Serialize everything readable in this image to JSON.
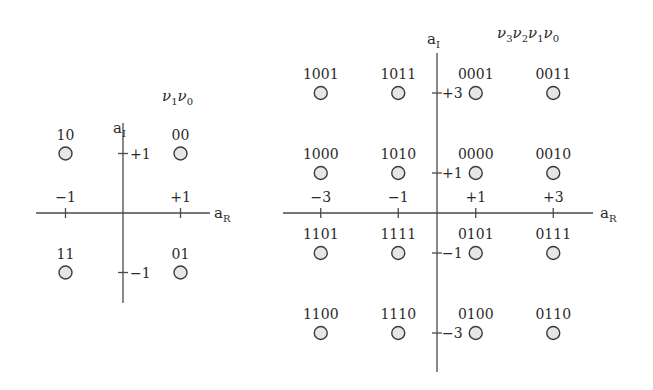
{
  "chart_data": [
    {
      "type": "scatter",
      "title": "QPSK constellation",
      "bit_label": {
        "symbol": "ν",
        "subscripts": [
          "1",
          "0"
        ]
      },
      "xlabel": {
        "base": "a",
        "sub": "R"
      },
      "ylabel": {
        "base": "a",
        "sub": "I"
      },
      "xlim": [
        -1.5,
        1.5
      ],
      "ylim": [
        -1.5,
        1.5
      ],
      "x_ticks": [
        {
          "value": -1,
          "label": "−1"
        },
        {
          "value": 1,
          "label": "+1"
        }
      ],
      "y_ticks": [
        {
          "value": 1,
          "label": "+1"
        },
        {
          "value": -1,
          "label": "−1"
        }
      ],
      "points": [
        {
          "x": -1,
          "y": 1,
          "label": "10"
        },
        {
          "x": 1,
          "y": 1,
          "label": "00"
        },
        {
          "x": -1,
          "y": -1,
          "label": "11"
        },
        {
          "x": 1,
          "y": -1,
          "label": "01"
        }
      ]
    },
    {
      "type": "scatter",
      "title": "16-QAM constellation",
      "bit_label": {
        "symbol": "ν",
        "subscripts": [
          "3",
          "2",
          "1",
          "0"
        ]
      },
      "xlabel": {
        "base": "a",
        "sub": "R"
      },
      "ylabel": {
        "base": "a",
        "sub": "I"
      },
      "xlim": [
        -4,
        4
      ],
      "ylim": [
        -4,
        4
      ],
      "x_ticks": [
        {
          "value": -3,
          "label": "−3"
        },
        {
          "value": -1,
          "label": "−1"
        },
        {
          "value": 1,
          "label": "+1"
        },
        {
          "value": 3,
          "label": "+3"
        }
      ],
      "y_ticks": [
        {
          "value": 3,
          "label": "+3"
        },
        {
          "value": 1,
          "label": "+1"
        },
        {
          "value": -1,
          "label": "−1"
        },
        {
          "value": -3,
          "label": "−3"
        }
      ],
      "points": [
        {
          "x": -3,
          "y": 3,
          "label": "1001"
        },
        {
          "x": -1,
          "y": 3,
          "label": "1011"
        },
        {
          "x": 1,
          "y": 3,
          "label": "0001"
        },
        {
          "x": 3,
          "y": 3,
          "label": "0011"
        },
        {
          "x": -3,
          "y": 1,
          "label": "1000"
        },
        {
          "x": -1,
          "y": 1,
          "label": "1010"
        },
        {
          "x": 1,
          "y": 1,
          "label": "0000"
        },
        {
          "x": 3,
          "y": 1,
          "label": "0010"
        },
        {
          "x": -3,
          "y": -1,
          "label": "1101"
        },
        {
          "x": -1,
          "y": -1,
          "label": "1111"
        },
        {
          "x": 1,
          "y": -1,
          "label": "0101"
        },
        {
          "x": 3,
          "y": -1,
          "label": "0111"
        },
        {
          "x": -3,
          "y": -3,
          "label": "1100"
        },
        {
          "x": -1,
          "y": -3,
          "label": "1110"
        },
        {
          "x": 1,
          "y": -3,
          "label": "0100"
        },
        {
          "x": 3,
          "y": -3,
          "label": "0110"
        }
      ]
    }
  ]
}
